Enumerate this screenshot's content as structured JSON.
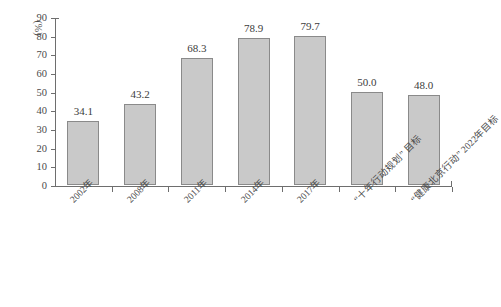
{
  "chart_data": {
    "type": "bar",
    "title": "",
    "xlabel": "",
    "ylabel": "(%)",
    "ylim": [
      0,
      90
    ],
    "ytick_step": 10,
    "grid": false,
    "legend": "none",
    "categories": [
      "2002年",
      "2008年",
      "2011年",
      "2014年",
      "2017年",
      "“十年行动规划” 目标",
      "“健康北京行动” 2022年目标"
    ],
    "values": [
      34.1,
      43.2,
      68.3,
      78.9,
      79.7,
      50.0,
      48.0
    ],
    "value_labels": [
      "34.1",
      "43.2",
      "68.3",
      "78.9",
      "79.7",
      "50.0",
      "48.0"
    ],
    "ytick_labels": [
      "0",
      "10",
      "20",
      "30",
      "40",
      "50",
      "60",
      "70",
      "80",
      "90"
    ],
    "bar_color": "#c9c9c9",
    "bar_border_color": "#8a8a8a",
    "axis_color": "#6e6e6e",
    "text_color": "#4a4a4a"
  }
}
